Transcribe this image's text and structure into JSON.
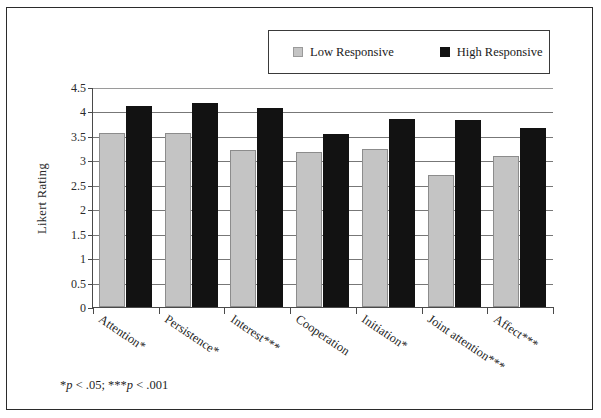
{
  "chart_data": {
    "type": "bar",
    "title": "",
    "xlabel": "",
    "ylabel": "Likert Rating",
    "ylim": [
      0,
      4.5
    ],
    "yticks": [
      "0",
      "0.5",
      "1",
      "1.5",
      "2",
      "2.5",
      "3",
      "3.5",
      "4",
      "4.5"
    ],
    "ytick_values": [
      0,
      0.5,
      1,
      1.5,
      2,
      2.5,
      3,
      3.5,
      4,
      4.5
    ],
    "grid": true,
    "legend_position": "top-right",
    "categories": [
      "Attention*",
      "Persistence*",
      "Interest***",
      "Cooperation",
      "Initiation*",
      "Joint attention***",
      "Affect***"
    ],
    "series": [
      {
        "name": "Low Responsive",
        "color": "#c4c4c4",
        "values": [
          3.55,
          3.55,
          3.21,
          3.18,
          3.24,
          2.7,
          3.08
        ]
      },
      {
        "name": "High Responsive",
        "color": "#121212",
        "values": [
          4.12,
          4.17,
          4.08,
          3.53,
          3.85,
          3.83,
          3.67
        ]
      }
    ],
    "annotations": [
      "*p < .05; ***p < .001"
    ]
  },
  "legend": {
    "low_label": "Low Responsive",
    "high_label": "High Responsive",
    "low_color": "#c4c4c4",
    "high_color": "#121212"
  },
  "axes": {
    "y_title": "Likert Rating"
  },
  "footnote": {
    "star1": "*",
    "p1": "p",
    "rest1": " < .05; ",
    "star3": "***",
    "p2": "p",
    "rest2": " < .001"
  }
}
